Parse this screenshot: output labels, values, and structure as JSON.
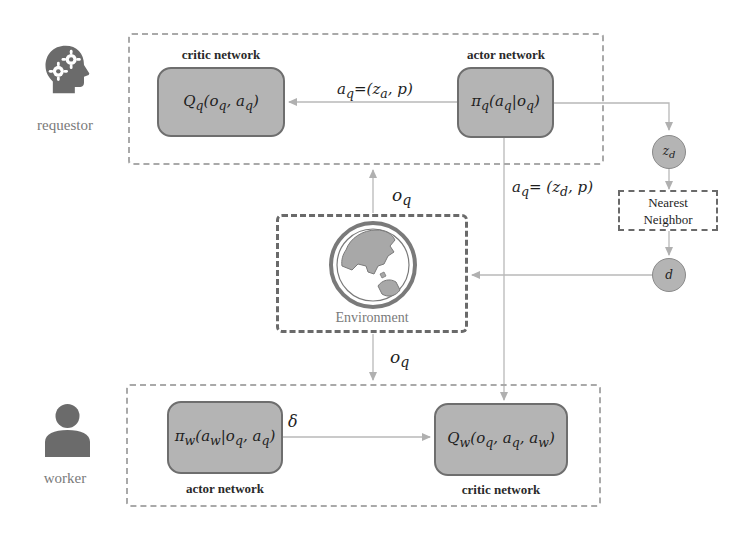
{
  "roles": {
    "requestor": {
      "label": "requestor",
      "icon": "head-gears-icon"
    },
    "worker": {
      "label": "worker",
      "icon": "person-icon"
    }
  },
  "requestor_group": {
    "critic": {
      "label": "critic network",
      "formula": "Qq(oq, aq)"
    },
    "actor": {
      "label": "actor network",
      "formula": "πq(aq|oq)"
    }
  },
  "worker_group": {
    "actor": {
      "label": "actor network",
      "formula": "πw(aw|oq, aq)"
    },
    "critic": {
      "label": "critic network",
      "formula": "Qw(oq, aq, aw)"
    }
  },
  "environment": {
    "label": "Environment",
    "icon": "globe-icon"
  },
  "nearest_neighbor": {
    "label_line1": "Nearest",
    "label_line2": "Neighbor"
  },
  "nodes": {
    "z_d": "zd",
    "d": "d"
  },
  "edges": {
    "actor_to_critic_top": "aq=(za, p)",
    "actor_to_worker_critic": "aq= (zd, p)",
    "env_to_requestor": "oq",
    "env_to_worker": "oq",
    "worker_actor_to_critic": "δ"
  },
  "colors": {
    "node_fill": "#b4b4b4",
    "node_border": "#6e6e6e",
    "group_border": "#a9a9a9",
    "arrow": "#b0b0b0",
    "icon": "#6b6b6b"
  }
}
